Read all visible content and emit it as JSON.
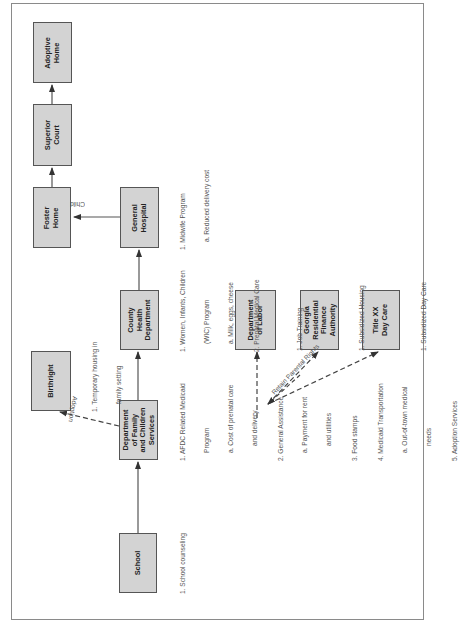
{
  "diagram": {
    "orientation": "rotated 90 degrees counter-clockwise",
    "colors": {
      "box_fill": "#d3d3d3",
      "box_border": "#555555",
      "line": "#555555",
      "frame": "#8a8a8a"
    },
    "nodes": {
      "school": {
        "label": "School",
        "notes": [
          "1. School counseling"
        ]
      },
      "dfcs": {
        "label": "Department\nof Family\nand Children\nServices",
        "notes": {
          "l1": "1. AFDC Related Medicaid",
          "l2": "Program",
          "l3": "a. Cost of prenatal care",
          "l4": "and delivery",
          "l5": "2. General Assistance",
          "l6": "a. Payment for rent",
          "l7": "and utilities",
          "l8": "3. Food stamps",
          "l9": "4. Medicaid Transportation",
          "l10": "a. Out-of-town medical",
          "l11": "needs",
          "l12": "5. Adoption Services"
        }
      },
      "birthright": {
        "label": "Birthright",
        "notes": {
          "l1": "1. Temporary housing in",
          "l2": "family setting"
        }
      },
      "county_health": {
        "label": "County\nHealth\nDepartment",
        "notes": {
          "l1": "1. Women, Infants, Children",
          "l2": "(WIC) Program",
          "l3": "a. Milk, eggs, cheese",
          "l4": "2. Prenatal Medical Care"
        }
      },
      "general_hospital": {
        "label": "General\nHospital",
        "notes": {
          "l1": "1. Midwife Program",
          "l2": "a. Reduced delivery cost"
        }
      },
      "foster_home": {
        "label": "Foster\nHome"
      },
      "superior_court": {
        "label": "Superior\nCourt"
      },
      "adoptive_home": {
        "label": "Adoptive\nHome"
      },
      "dept_labor": {
        "label": "Department\nof Labor",
        "notes": {
          "l1": "1. Job Training"
        }
      },
      "georgia_residential": {
        "label": "Georgia\nResidential\nFinance\nAuthority",
        "notes": {
          "l1": "1. Subsidized Housing"
        }
      },
      "title_xx": {
        "label": "Title XX\nDay Care",
        "notes": {
          "l1": "1. Subsidized Day Care"
        }
      }
    },
    "edges": {
      "adoption": "Adoption",
      "child": "Child",
      "retain_parental_rights": "Retain Parental Rights"
    }
  }
}
